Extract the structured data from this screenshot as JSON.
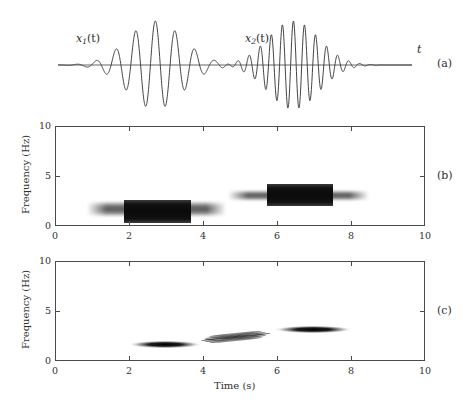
{
  "figure": {
    "panel_markers": [
      "(a)",
      "(b)",
      "(c)"
    ],
    "signal_labels": {
      "x1": "x",
      "x1_sub": "1",
      "x2": "x",
      "x2_sub": "2",
      "arg": "(t)",
      "time_axis": "t"
    },
    "axis_titles": {
      "y": "Frequency (Hz)",
      "x": "Time (s)"
    },
    "x_ticks": [
      "0",
      "2",
      "4",
      "6",
      "8",
      "10"
    ],
    "y_ticks": [
      "0",
      "5",
      "10"
    ],
    "colors": {
      "axis": "#4a4a4a",
      "curve": "#3a3a3a",
      "ink": "#2f2f2f",
      "background": "#ffffff"
    }
  },
  "chart_data": [
    {
      "type": "line",
      "panel": "(a)",
      "title": "",
      "xlabel": "t",
      "ylabel": "",
      "xlim": [
        0,
        10
      ],
      "ylim": [
        -1.15,
        1.15
      ],
      "grid": false,
      "annotations": [
        "x1(t)",
        "x2(t)",
        "t"
      ],
      "description": "Two Gaussian-modulated sinusoidal wave packets on a baseline axis",
      "series": [
        {
          "name": "x1(t)",
          "kind": "gaussian-modulated-sinusoid",
          "center_time": 2.75,
          "frequency_hz": 1.8,
          "gaussian_sigma": 0.78,
          "amplitude": 1.0
        },
        {
          "name": "x2(t)",
          "kind": "gaussian-modulated-sinusoid",
          "center_time": 6.65,
          "frequency_hz": 3.2,
          "gaussian_sigma": 0.72,
          "amplitude": 1.0
        }
      ]
    },
    {
      "type": "heatmap",
      "panel": "(b)",
      "title": "",
      "xlabel": "",
      "ylabel": "Frequency (Hz)",
      "xlim": [
        0,
        10
      ],
      "ylim": [
        0,
        10
      ],
      "xticks": [
        0,
        2,
        4,
        6,
        8,
        10
      ],
      "yticks": [
        0,
        5,
        10
      ],
      "grid": false,
      "colormap": "gray-inverted",
      "description": "Spectrogram (STFT) showing two smeared rectangular energy blobs, no cross-terms",
      "components": [
        {
          "name": "x1 component",
          "time_center": 2.75,
          "time_span": [
            0.85,
            4.6
          ],
          "core_time_span": [
            1.85,
            3.65
          ],
          "frequency_center": 1.8,
          "frequency_span": [
            1.0,
            2.6
          ],
          "core_frequency_span": [
            0.45,
            2.75
          ],
          "peak_intensity": 1.0
        },
        {
          "name": "x2 component",
          "time_center": 6.65,
          "time_span": [
            4.65,
            8.45
          ],
          "core_time_span": [
            5.7,
            7.5
          ],
          "frequency_center": 3.2,
          "frequency_span": [
            2.6,
            3.7
          ],
          "core_frequency_span": [
            2.1,
            4.35
          ],
          "peak_intensity": 1.0
        }
      ]
    },
    {
      "type": "heatmap",
      "panel": "(c)",
      "title": "",
      "xlabel": "Time (s)",
      "ylabel": "Frequency (Hz)",
      "xlim": [
        0,
        10
      ],
      "ylim": [
        0,
        10
      ],
      "xticks": [
        0,
        2,
        4,
        6,
        8,
        10
      ],
      "yticks": [
        0,
        5,
        10
      ],
      "grid": false,
      "colormap": "gray-inverted",
      "description": "Wigner-Ville distribution: two sharply concentrated auto-term ellipses plus oscillatory cross-terms midway between them",
      "components": [
        {
          "name": "auto-term x1",
          "kind": "auto-term",
          "time_center": 2.95,
          "time_span": [
            1.95,
            3.95
          ],
          "frequency_center": 1.75,
          "frequency_span": [
            1.35,
            2.15
          ],
          "peak_intensity": 1.0
        },
        {
          "name": "auto-term x2",
          "kind": "auto-term",
          "time_center": 6.95,
          "time_span": [
            5.95,
            8.1
          ],
          "frequency_center": 3.25,
          "frequency_span": [
            2.85,
            3.65
          ],
          "peak_intensity": 1.0
        },
        {
          "name": "cross-term",
          "kind": "cross-term",
          "time_center": 4.85,
          "time_span": [
            4.05,
            5.95
          ],
          "frequency_center": 2.5,
          "frequency_span": [
            2.15,
            2.9
          ],
          "oscillation_stripes": 5,
          "peak_intensity": 0.75
        }
      ]
    }
  ]
}
